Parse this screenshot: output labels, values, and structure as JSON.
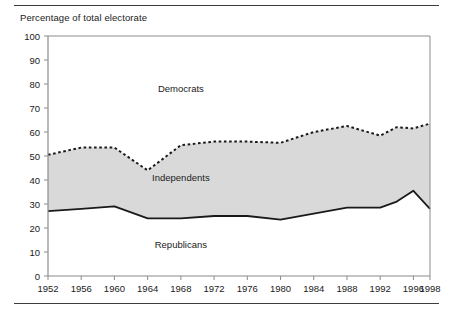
{
  "chart_data": {
    "type": "area",
    "title": "Percentage of total electorate",
    "xlabel": "",
    "ylabel": "Percentage of total electorate",
    "ylim": [
      0,
      100
    ],
    "ytick_step": 10,
    "yticks": [
      0,
      10,
      20,
      30,
      40,
      50,
      60,
      70,
      80,
      90,
      100
    ],
    "grid": false,
    "legend_position": "inline-annotations",
    "x": [
      1952,
      1956,
      1960,
      1964,
      1968,
      1972,
      1976,
      1980,
      1984,
      1988,
      1992,
      1994,
      1996,
      1998
    ],
    "xticks": [
      1952,
      1956,
      1960,
      1964,
      1968,
      1972,
      1976,
      1980,
      1984,
      1988,
      1992,
      1996,
      1998
    ],
    "xtick_labels": [
      "1952",
      "1956",
      "1960",
      "1964",
      "1968",
      "1972",
      "1976",
      "1980",
      "1984",
      "1988",
      "1992",
      "1996",
      "1998"
    ],
    "series": [
      {
        "name": "Republicans",
        "style": "solid-line",
        "description": "Lower boundary: cumulative Republican share",
        "values": [
          27,
          28,
          29,
          24,
          24,
          25,
          25,
          23.5,
          26,
          28.5,
          28.5,
          31,
          35.5,
          28
        ]
      },
      {
        "name": "Independents",
        "style": "shaded-band",
        "description": "Shaded band between Republican line and dotted line",
        "values": [
          23.5,
          25.5,
          24.5,
          20,
          30.5,
          31,
          31,
          32,
          34,
          34,
          30,
          31,
          26,
          35.5
        ]
      },
      {
        "name": "Democrats",
        "style": "dotted-line",
        "description": "Upper boundary: cumulative Republicans + Independents",
        "values": [
          50.5,
          53.5,
          53.5,
          44,
          54.5,
          56,
          56,
          55.5,
          60,
          62.5,
          58.5,
          62,
          61.5,
          63.5
        ]
      }
    ],
    "annotations": [
      {
        "text": "Democrats",
        "x": 1968,
        "y": 78
      },
      {
        "text": "Independents",
        "x": 1968,
        "y": 41
      },
      {
        "text": "Republicans",
        "x": 1968,
        "y": 13
      }
    ],
    "colors": {
      "band_fill": "#d9d9d9",
      "line": "#1a1a1a",
      "axis": "#8c8c8c",
      "background": "#ffffff"
    }
  }
}
